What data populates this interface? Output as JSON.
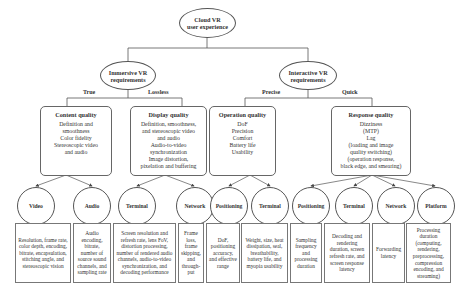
{
  "root": {
    "label": "Cloud VR\nuser experience"
  },
  "level1": [
    {
      "label": "Immersive VR\nrequirements"
    },
    {
      "label": "Interactive VR\nrequirements"
    }
  ],
  "edge_labels": {
    "true": "True",
    "lossless": "Lossless",
    "precise": "Precise",
    "quick": "Quick"
  },
  "categories": [
    {
      "title": "Content quality",
      "lines": [
        "Definition and",
        "smoothness",
        "Color fidelity",
        "Stereoscopic video",
        "and audio"
      ]
    },
    {
      "title": "Display quality",
      "lines": [
        "Definition, smoothness,",
        "and stereoscopic video",
        "and audio",
        "Audio-to-video",
        "synchronization",
        "Image distortion,",
        "pixelation and buffering"
      ]
    },
    {
      "title": "Operation quality",
      "lines": [
        "DoF",
        "Precision",
        "Comfort",
        "Battery life",
        "Usability"
      ]
    },
    {
      "title": "Response quality",
      "lines": [
        "Dizziness",
        "(MTP)",
        "Lag",
        "(loading and image",
        "quality switching)",
        "(operation response,",
        "black edge, and smearing)"
      ]
    }
  ],
  "leaves": [
    {
      "name": "Video",
      "desc": "Resolution, frame rate, color depth, encoding, bitrate, encapsulation, stitching angle, and stereoscopic vision"
    },
    {
      "name": "Audio",
      "desc": "Audio encoding, bitrate, number of source sound channels, and sampling rate"
    },
    {
      "name": "Terminal",
      "desc": "Screen resolution and refresh rate, lens FoV, distortion processing, number of rendered audio channels, audio-to-video synchronization, and decoding performance"
    },
    {
      "name": "Network",
      "desc": "Frame loss, frame skipping, and through-put"
    },
    {
      "name": "Positioning",
      "desc": "DoF, positioning accuracy, and effective range"
    },
    {
      "name": "Terminal",
      "desc": "Weight, size, heat dissipation, seal, breathability, battery life, and myopia usability"
    },
    {
      "name": "Positioning",
      "desc": "Sampling frequency and processing duration"
    },
    {
      "name": "Terminal",
      "desc": "Decoding and rendering duration, screen refresh rate, and screen response latency"
    },
    {
      "name": "Network",
      "desc": "Forwarding latency"
    },
    {
      "name": "Platform",
      "desc": "Processing duration (computing, rendering, preprocessing, compression encoding, and streaming)"
    }
  ]
}
